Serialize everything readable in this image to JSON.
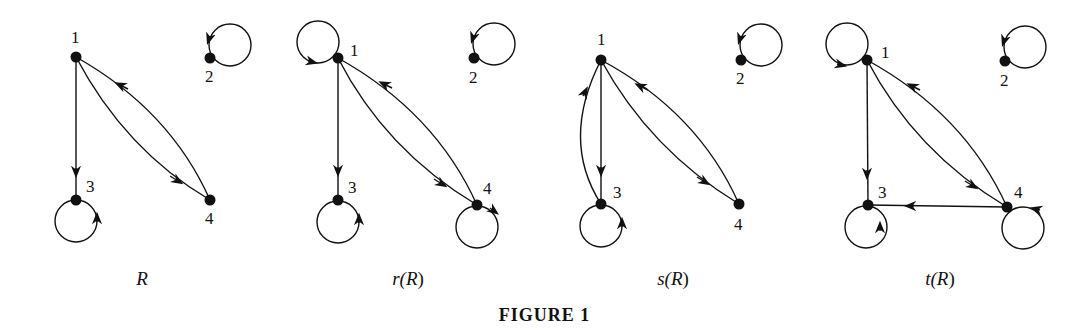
{
  "figure": {
    "caption": "FIGURE 1",
    "stroke_color": "#111111",
    "background": "#ffffff"
  },
  "graphs": [
    {
      "id": "R",
      "label": "R",
      "label_prefix": "",
      "label_var": "R",
      "nodes": [
        {
          "id": "1",
          "x": 76,
          "y": 57
        },
        {
          "id": "2",
          "x": 210,
          "y": 58
        },
        {
          "id": "3",
          "x": 76,
          "y": 200
        },
        {
          "id": "4",
          "x": 210,
          "y": 200
        }
      ],
      "edges": [
        {
          "from": "1",
          "to": "3"
        },
        {
          "from": "1",
          "to": "4"
        },
        {
          "from": "4",
          "to": "1"
        },
        {
          "from": "2",
          "to": "2"
        },
        {
          "from": "3",
          "to": "3"
        }
      ]
    },
    {
      "id": "rR",
      "label": "r(R)",
      "label_prefix": "r(",
      "label_var": "R",
      "nodes": [
        {
          "id": "1",
          "x": 338,
          "y": 58
        },
        {
          "id": "2",
          "x": 474,
          "y": 58
        },
        {
          "id": "3",
          "x": 338,
          "y": 200
        },
        {
          "id": "4",
          "x": 477,
          "y": 205
        }
      ],
      "edges": [
        {
          "from": "1",
          "to": "1"
        },
        {
          "from": "1",
          "to": "3"
        },
        {
          "from": "1",
          "to": "4"
        },
        {
          "from": "4",
          "to": "1"
        },
        {
          "from": "2",
          "to": "2"
        },
        {
          "from": "3",
          "to": "3"
        },
        {
          "from": "4",
          "to": "4"
        }
      ]
    },
    {
      "id": "sR",
      "label": "s(R)",
      "label_prefix": "s(",
      "label_var": "R",
      "nodes": [
        {
          "id": "1",
          "x": 601,
          "y": 60
        },
        {
          "id": "2",
          "x": 741,
          "y": 60
        },
        {
          "id": "3",
          "x": 601,
          "y": 204
        },
        {
          "id": "4",
          "x": 739,
          "y": 204
        }
      ],
      "edges": [
        {
          "from": "1",
          "to": "3"
        },
        {
          "from": "3",
          "to": "1"
        },
        {
          "from": "1",
          "to": "4"
        },
        {
          "from": "4",
          "to": "1"
        },
        {
          "from": "2",
          "to": "2"
        },
        {
          "from": "3",
          "to": "3"
        }
      ]
    },
    {
      "id": "tR",
      "label": "t(R)",
      "label_prefix": "t(",
      "label_var": "R",
      "nodes": [
        {
          "id": "1",
          "x": 867,
          "y": 60
        },
        {
          "id": "2",
          "x": 1005,
          "y": 61
        },
        {
          "id": "3",
          "x": 868,
          "y": 205
        },
        {
          "id": "4",
          "x": 1007,
          "y": 207
        }
      ],
      "edges": [
        {
          "from": "1",
          "to": "1"
        },
        {
          "from": "1",
          "to": "3"
        },
        {
          "from": "1",
          "to": "4"
        },
        {
          "from": "4",
          "to": "1"
        },
        {
          "from": "4",
          "to": "3"
        },
        {
          "from": "2",
          "to": "2"
        },
        {
          "from": "3",
          "to": "3"
        },
        {
          "from": "4",
          "to": "4"
        }
      ]
    }
  ],
  "labels": {
    "g0": {
      "prefix": "",
      "var": "R",
      "suffix": ""
    },
    "g1": {
      "prefix": "r(",
      "var": "R",
      "suffix": ")"
    },
    "g2": {
      "prefix": "s(",
      "var": "R",
      "suffix": ")"
    },
    "g3": {
      "prefix": "t(",
      "var": "R",
      "suffix": ")"
    }
  },
  "node_labels": {
    "n1": "1",
    "n2": "2",
    "n3": "3",
    "n4": "4"
  }
}
